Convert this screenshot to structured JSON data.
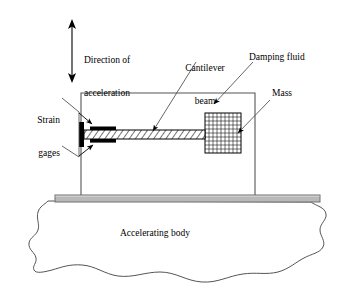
{
  "figure": {
    "type": "schematic-diagram",
    "background_color": "#ffffff",
    "line_color": "#000000"
  },
  "labels": {
    "direction": {
      "line1": "Direction of",
      "line2": "acceleration"
    },
    "strain_gages": {
      "line1": "Strain",
      "line2": "gages"
    },
    "cantilever_beam": {
      "line1": "Cantilever",
      "line2": "beam"
    },
    "damping_fluid": {
      "text": "Damping fluid"
    },
    "mass": {
      "text": "Mass"
    },
    "accelerating_body": {
      "text": "Accelerating body"
    }
  },
  "parts": {
    "housing": {
      "name": "housing-box",
      "x": 81,
      "y": 93,
      "width": 174,
      "height": 102,
      "fill": "none",
      "stroke": "#000000"
    },
    "base_plate": {
      "name": "base-plate",
      "x": 55,
      "y": 195,
      "width": 265,
      "height": 7,
      "fill": "#b9b9b9",
      "stroke": "#6f6f6f"
    },
    "beam": {
      "name": "cantilever-beam",
      "x": 84,
      "y": 130,
      "width": 121,
      "height": 9,
      "hatch": "diagonal",
      "stroke": "#000000"
    },
    "clamp": {
      "name": "beam-clamp",
      "x": 80,
      "y": 122,
      "width": 4,
      "height": 25,
      "fill": "#000000"
    },
    "gage_upper": {
      "name": "strain-gage-upper",
      "x": 90,
      "y": 127,
      "width": 26,
      "height": 3.5,
      "fill": "#000000"
    },
    "gage_lower": {
      "name": "strain-gage-lower",
      "x": 90,
      "y": 139,
      "width": 26,
      "height": 3.5,
      "fill": "#000000"
    },
    "mass_block": {
      "name": "mass-block",
      "x": 205,
      "y": 113,
      "width": 36,
      "height": 40,
      "grid_cols": 9,
      "grid_rows": 9,
      "stroke": "#000000"
    },
    "arrow_acceleration": {
      "name": "acceleration-arrow",
      "x": 72,
      "y_top": 22,
      "y_bottom": 80,
      "double_headed": true
    }
  },
  "colors": {
    "outline": "#000000",
    "base_fill": "#b9b9b9",
    "base_edge": "#6f6f6f",
    "leader": "#3a3a3a",
    "body_outline": "#555555"
  }
}
